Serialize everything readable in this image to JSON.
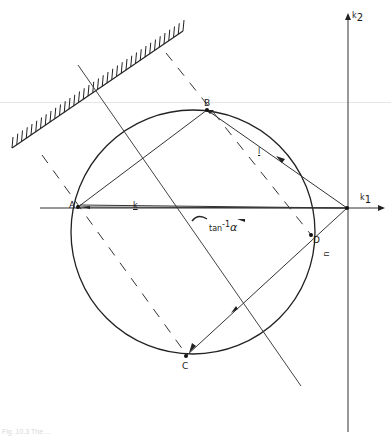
{
  "figure": {
    "caption": "Fig. 10.3 The ...",
    "axes": {
      "x_label": "k",
      "x_subscript": "1",
      "y_label": "k",
      "y_subscript": "2"
    },
    "points": {
      "A": "A",
      "B": "B",
      "C": "C",
      "D": "D"
    },
    "vectors": {
      "k": "k",
      "l": "l",
      "n": "n"
    },
    "angle_label": "tan",
    "angle_exponent": "-1",
    "angle_symbol": "α",
    "colors": {
      "ink": "#222222",
      "background": "#ffffff"
    }
  }
}
